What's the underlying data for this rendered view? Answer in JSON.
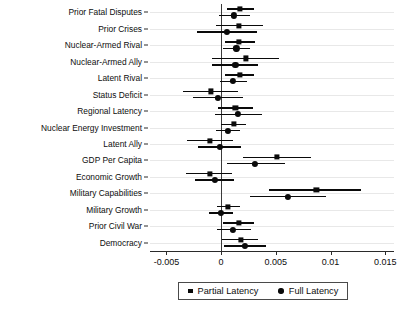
{
  "chart_data": {
    "type": "scatter",
    "subtype": "coefficient-plot",
    "title": "",
    "xlabel": "",
    "ylabel": "",
    "xlim": [
      -0.0065,
      0.0158
    ],
    "grid": true,
    "zero_reference_line": 0,
    "legend_position": "bottom-center",
    "xticks": [
      -0.005,
      0,
      0.005,
      0.01,
      0.015
    ],
    "xticklabels": [
      "-0.005",
      "0",
      "0.005",
      "0.01",
      "0.015"
    ],
    "categories": [
      "Prior Fatal Disputes",
      "Prior Crises",
      "Nuclear-Armed Rival",
      "Nuclear-Armed Ally",
      "Latent Rival",
      "Status Deficit",
      "Regional Latency",
      "Nuclear Energy Investment",
      "Latent Ally",
      "GDP Per Capita",
      "Economic Growth",
      "Military Capabilities",
      "Military Growth",
      "Prior Civil War",
      "Democracy"
    ],
    "series": [
      {
        "name": "Partial Latency",
        "marker": "square",
        "color": "#0a0a0a",
        "values": [
          0.0017,
          0.0016,
          0.0016,
          0.0023,
          0.0017,
          -0.0009,
          0.0013,
          0.0012,
          -0.001,
          0.0051,
          -0.001,
          0.0087,
          0.0006,
          0.0016,
          0.0018
        ],
        "ci_low": [
          0.0005,
          -0.0005,
          0.0004,
          -0.0008,
          0.0004,
          -0.0035,
          -0.0003,
          0.0,
          -0.0031,
          0.002,
          -0.0032,
          0.0044,
          -0.0004,
          0.0002,
          0.0001
        ],
        "ci_high": [
          0.003,
          0.0038,
          0.0031,
          0.0053,
          0.003,
          0.0015,
          0.0029,
          0.0023,
          0.0011,
          0.0082,
          0.001,
          0.0128,
          0.0017,
          0.003,
          0.0034
        ]
      },
      {
        "name": "Full Latency",
        "marker": "circle",
        "color": "#0a0a0a",
        "values": [
          0.0012,
          0.0005,
          0.0014,
          0.0013,
          0.0011,
          -0.0003,
          0.0015,
          0.0006,
          -0.0001,
          0.0031,
          -0.0006,
          0.0061,
          0.0,
          0.0011,
          0.0022
        ],
        "ci_low": [
          -0.0002,
          -0.0022,
          0.0002,
          -0.0008,
          -0.0001,
          -0.0026,
          -0.0006,
          -0.0005,
          -0.0021,
          0.0005,
          -0.0024,
          0.0026,
          -0.0011,
          -0.0004,
          0.0003
        ],
        "ci_high": [
          0.0026,
          0.0033,
          0.0026,
          0.0034,
          0.0024,
          0.002,
          0.0037,
          0.0017,
          0.0018,
          0.0058,
          0.0012,
          0.0096,
          0.0011,
          0.0027,
          0.0041
        ]
      }
    ]
  },
  "legend": {
    "items": [
      {
        "label": "Partial Latency",
        "marker": "square"
      },
      {
        "label": "Full Latency",
        "marker": "circle"
      }
    ]
  }
}
